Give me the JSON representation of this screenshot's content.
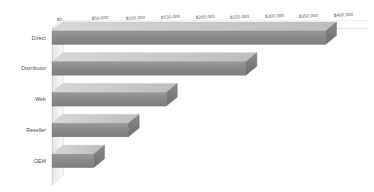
{
  "chart_data": {
    "type": "bar",
    "orientation": "horizontal",
    "style": "3d",
    "title": "",
    "subtitle": "",
    "xlabel": "",
    "ylabel": "",
    "categories": [
      "Direct",
      "Distributor",
      "Web",
      "Reseller",
      "OEM"
    ],
    "values": [
      395000,
      280000,
      165000,
      110000,
      60000
    ],
    "series": [
      {
        "name": "",
        "values": [
          395000,
          280000,
          165000,
          110000,
          60000
        ]
      }
    ],
    "xlim": [
      0,
      400000
    ],
    "xticks": [
      0,
      50000,
      100000,
      150000,
      200000,
      250000,
      300000,
      350000,
      400000
    ],
    "xtick_labels": [
      "$0",
      "$50,000",
      "$100,000",
      "$150,000",
      "$200,000",
      "$250,000",
      "$300,000",
      "$350,000",
      "$400,000"
    ],
    "ytick_labels": [
      "Direct",
      "Distributor",
      "Web",
      "Reseller",
      "OEM"
    ],
    "grid": false,
    "legend": false,
    "legend_position": "none",
    "annotations": [],
    "colors": {
      "bar_face": "#8b8b8b",
      "bar_top": "#c9c9c9",
      "bar_side": "#6f6f6f",
      "background": "#ffffff",
      "wall": "#f2f2f2",
      "axis_line": "#c0c0c0",
      "label_text": "#4a4a4a",
      "tick_text": "#5a5a5a"
    }
  },
  "axis": {
    "ticks": [
      {
        "label": "$0",
        "value": 0
      },
      {
        "label": "$50,000",
        "value": 50000
      },
      {
        "label": "$100,000",
        "value": 100000
      },
      {
        "label": "$150,000",
        "value": 150000
      },
      {
        "label": "$200,000",
        "value": 200000
      },
      {
        "label": "$250,000",
        "value": 250000
      },
      {
        "label": "$300,000",
        "value": 300000
      },
      {
        "label": "$350,000",
        "value": 350000
      },
      {
        "label": "$400,000",
        "value": 400000
      }
    ]
  },
  "bars": [
    {
      "label": "Direct",
      "value": 395000
    },
    {
      "label": "Distributor",
      "value": 280000
    },
    {
      "label": "Web",
      "value": 165000
    },
    {
      "label": "Reseller",
      "value": 110000
    },
    {
      "label": "OEM",
      "value": 60000
    }
  ]
}
